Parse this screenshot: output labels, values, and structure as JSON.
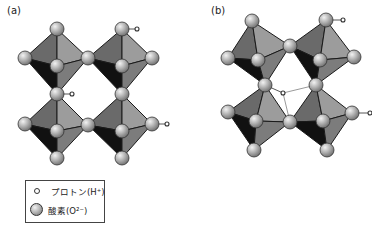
{
  "panels": {
    "a": {
      "label": "(a)"
    },
    "b": {
      "label": "(b)"
    }
  },
  "legend": {
    "proton_label": "プロトン(H⁺)",
    "oxygen_label": "酸素(O²⁻)"
  },
  "colors": {
    "face_upper_left": "#6a6a6a",
    "face_upper_right": "#9c9c9c",
    "face_lower_left": "#111111",
    "face_lower_right": "#7c7c7c",
    "edge": "#1a1a1a",
    "atom_highlight": "#f2f2f2",
    "atom_mid": "#b8b8b8",
    "atom_shadow": "#6e6e6e",
    "bond_line": "#9a9a9a"
  },
  "structures": {
    "a": {
      "octahedra": [
        {
          "top": [
            57,
            29
          ],
          "left": [
            25,
            58
          ],
          "right": [
            88,
            58
          ],
          "front": [
            57,
            66
          ],
          "bottom": [
            57,
            94
          ]
        },
        {
          "top": [
            122,
            29
          ],
          "left": [
            88,
            58
          ],
          "right": [
            152,
            58
          ],
          "front": [
            122,
            66
          ],
          "bottom": [
            122,
            94
          ]
        },
        {
          "top": [
            57,
            94
          ],
          "left": [
            25,
            124
          ],
          "right": [
            88,
            125
          ],
          "front": [
            57,
            131
          ],
          "bottom": [
            57,
            158
          ]
        },
        {
          "top": [
            122,
            94
          ],
          "left": [
            88,
            125
          ],
          "right": [
            152,
            124
          ],
          "front": [
            122,
            131
          ],
          "bottom": [
            122,
            158
          ]
        }
      ],
      "oxygens": [
        [
          57,
          29
        ],
        [
          122,
          29
        ],
        [
          25,
          58
        ],
        [
          88,
          58
        ],
        [
          152,
          58
        ],
        [
          57,
          66
        ],
        [
          122,
          66
        ],
        [
          57,
          94
        ],
        [
          122,
          94
        ],
        [
          25,
          124
        ],
        [
          88,
          125
        ],
        [
          152,
          124
        ],
        [
          57,
          131
        ],
        [
          122,
          131
        ],
        [
          57,
          158
        ],
        [
          122,
          158
        ]
      ],
      "protons": [
        {
          "atom": [
            122,
            29
          ],
          "pos": [
            137,
            29
          ]
        },
        {
          "atom": [
            57,
            94
          ],
          "pos": [
            72,
            94
          ]
        },
        {
          "atom": [
            152,
            124
          ],
          "pos": [
            167,
            124
          ]
        }
      ],
      "hbonds": []
    },
    "b": {
      "octahedra": [
        {
          "top": [
            252,
            21
          ],
          "left": [
            228,
            58
          ],
          "right": [
            290,
            46
          ],
          "front": [
            258,
            60
          ],
          "bottom": [
            265,
            85
          ]
        },
        {
          "top": [
            326,
            20
          ],
          "left": [
            290,
            46
          ],
          "right": [
            354,
            57
          ],
          "front": [
            320,
            60
          ],
          "bottom": [
            316,
            85
          ]
        },
        {
          "top": [
            265,
            85
          ],
          "left": [
            228,
            112
          ],
          "right": [
            290,
            122
          ],
          "front": [
            256,
            121
          ],
          "bottom": [
            254,
            150
          ]
        },
        {
          "top": [
            316,
            85
          ],
          "left": [
            290,
            122
          ],
          "right": [
            352,
            113
          ],
          "front": [
            323,
            121
          ],
          "bottom": [
            327,
            150
          ]
        }
      ],
      "oxygens": [
        [
          252,
          21
        ],
        [
          326,
          20
        ],
        [
          228,
          58
        ],
        [
          290,
          46
        ],
        [
          354,
          57
        ],
        [
          258,
          60
        ],
        [
          320,
          60
        ],
        [
          265,
          85
        ],
        [
          316,
          85
        ],
        [
          228,
          112
        ],
        [
          290,
          122
        ],
        [
          352,
          113
        ],
        [
          256,
          121
        ],
        [
          323,
          121
        ],
        [
          254,
          150
        ],
        [
          327,
          150
        ]
      ],
      "protons": [
        {
          "atom": [
            326,
            20
          ],
          "pos": [
            343,
            20
          ]
        },
        {
          "atom": [
            265,
            85
          ],
          "pos": [
            283,
            93
          ]
        },
        {
          "atom": [
            352,
            113
          ],
          "pos": [
            370,
            113
          ]
        }
      ],
      "hbonds": [
        {
          "from": [
            283,
            93
          ],
          "to": [
            316,
            85
          ]
        },
        {
          "from": [
            283,
            93
          ],
          "to": [
            290,
            122
          ]
        }
      ]
    }
  }
}
